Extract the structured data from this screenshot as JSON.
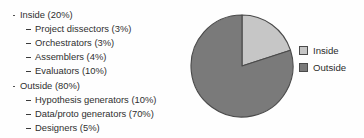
{
  "figure": {
    "background_color": "#fefefe"
  },
  "taxonomy": {
    "groups": [
      {
        "label": "Inside (20%)",
        "name": "Inside",
        "share": "20%",
        "items": [
          {
            "label": "Project dissectors (3%)",
            "name": "Project dissectors",
            "share": "3%"
          },
          {
            "label": "Orchestrators (3%)",
            "name": "Orchestrators",
            "share": "3%"
          },
          {
            "label": "Assemblers (4%)",
            "name": "Assemblers",
            "share": "4%"
          },
          {
            "label": "Evaluators (10%)",
            "name": "Evaluators",
            "share": "10%"
          }
        ]
      },
      {
        "label": "Outside (80%)",
        "name": "Outside",
        "share": "80%",
        "items": [
          {
            "label": "Hypothesis generators (10%)",
            "name": "Hypothesis generators",
            "share": "10%"
          },
          {
            "label": "Data/proto generators (70%)",
            "name": "Data/proto generators",
            "share": "70%"
          },
          {
            "label": "Designers (5%)",
            "name": "Designers",
            "share": "5%"
          }
        ]
      }
    ]
  },
  "legend": {
    "position": "right",
    "entries": [
      {
        "label": "Inside",
        "color": "#c6c6c6",
        "border_color": "#4a4a4a"
      },
      {
        "label": "Outside",
        "color": "#7a7a7a",
        "border_color": "#4a4a4a"
      }
    ]
  },
  "chart_data": {
    "type": "pie",
    "title": "",
    "subtitle": "",
    "xlabel": "",
    "ylabel": "",
    "grid": false,
    "legend_position": "right",
    "start_angle_deg": 90,
    "direction": "clockwise",
    "categories": [
      "Inside",
      "Outside"
    ],
    "values": [
      20,
      80
    ],
    "value_labels": [
      "20%",
      "80%"
    ],
    "colors": [
      "#c6c6c6",
      "#7a7a7a"
    ],
    "outline_color": "#4a4a4a",
    "units": "percent",
    "slices": [
      {
        "label": "Inside",
        "value": 20,
        "value_label": "20%",
        "color": "#c6c6c6"
      },
      {
        "label": "Outside",
        "value": 80,
        "value_label": "80%",
        "color": "#7a7a7a"
      }
    ]
  }
}
